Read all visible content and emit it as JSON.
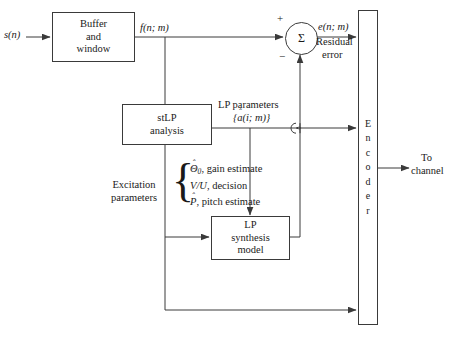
{
  "diagram": {
    "stroke_color": "#3a3a3a",
    "background": "#ffffff"
  },
  "signals": {
    "input": "s(n)",
    "framed": "f(n; m)",
    "error": "e(n; m)",
    "error_caption_line1": "Residual",
    "error_caption_line2": "error",
    "output_line1": "To",
    "output_line2": "channel",
    "plus": "+",
    "minus": "−",
    "sigma": "Σ"
  },
  "blocks": {
    "buffer": {
      "line1": "Buffer",
      "line2": "and",
      "line3": "window"
    },
    "stlp": {
      "line1": "stLP",
      "line2": "analysis"
    },
    "lp_synth": {
      "line1": "LP",
      "line2": "synthesis",
      "line3": "model"
    },
    "encoder": {
      "letters": [
        "E",
        "n",
        "c",
        "o",
        "d",
        "e",
        "r"
      ],
      "name": "Encoder"
    }
  },
  "labels": {
    "lp_parameters_title": "LP parameters",
    "lp_parameters_symbol_prefix": "{",
    "lp_parameters_symbol_base": "a",
    "lp_parameters_symbol_hat": "ˆ",
    "lp_parameters_symbol_args": "(i; m)}",
    "excitation_line1": "Excitation",
    "excitation_line2": "parameters",
    "brace_glyph": "{"
  },
  "excitation_rows": [
    {
      "symbol_base": "Θ",
      "symbol_hat": "ˆ",
      "symbol_sub": "0",
      "text": ", gain estimate"
    },
    {
      "symbol_base": "V/U",
      "symbol_hat": "",
      "symbol_sub": "",
      "text": ", decision"
    },
    {
      "symbol_base": "P",
      "symbol_hat": "ˆ",
      "symbol_sub": "",
      "text": ", pitch estimate"
    }
  ]
}
